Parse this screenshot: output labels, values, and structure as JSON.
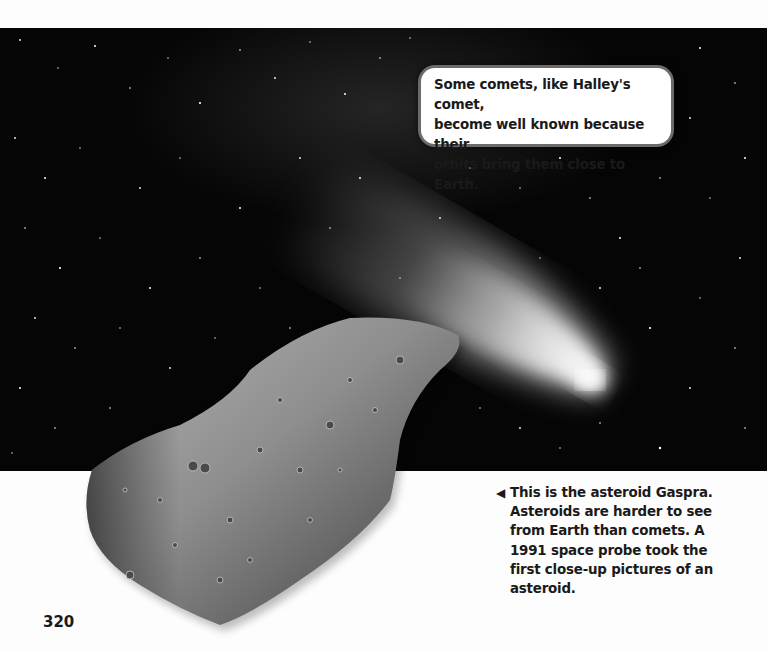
{
  "page": {
    "number": "320",
    "background": "#ffffff"
  },
  "photo": {
    "subject": "comet-and-asteroid-in-space",
    "sky_color": "#050505",
    "comet_glow_color": "#f2f2f2"
  },
  "callout": {
    "text": "Some comets, like Halley's comet, become well known because their orbits bring them close to Earth.",
    "lines": [
      "Some comets, like Halley's comet,",
      "become well known because their",
      "orbits bring them close to Earth."
    ]
  },
  "caption": {
    "pointer_icon": "◀",
    "lines": [
      "This is the asteroid Gaspra.",
      "Asteroids are harder to see",
      "from Earth than comets. A",
      "1991 space probe took the",
      "first close-up pictures of an",
      "asteroid."
    ]
  }
}
